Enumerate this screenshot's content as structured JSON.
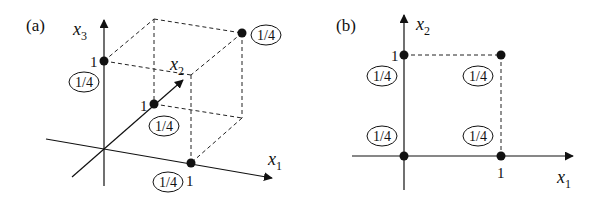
{
  "figure": {
    "panel_a": {
      "label": "(a)",
      "axes": {
        "x1": {
          "name": "x",
          "sub": "1",
          "tick": "1"
        },
        "x2": {
          "name": "x",
          "sub": "2",
          "tick": "1"
        },
        "x3": {
          "name": "x",
          "sub": "3",
          "tick": "1"
        }
      },
      "points": [
        {
          "coords": "(0,0,1)",
          "prob": "1/4"
        },
        {
          "coords": "(0,1,0)",
          "prob": "1/4"
        },
        {
          "coords": "(1,0,0)",
          "prob": "1/4"
        },
        {
          "coords": "(1,1,1)",
          "prob": "1/4"
        }
      ]
    },
    "panel_b": {
      "label": "(b)",
      "axes": {
        "x1": {
          "name": "x",
          "sub": "1",
          "tick": "1"
        },
        "x2": {
          "name": "x",
          "sub": "2",
          "tick": "1"
        }
      },
      "points": [
        {
          "coords": "(0,1)",
          "prob": "1/4"
        },
        {
          "coords": "(1,1)",
          "prob": "1/4"
        },
        {
          "coords": "(0,0)",
          "prob": "1/4"
        },
        {
          "coords": "(1,0)",
          "prob": "1/4"
        }
      ]
    }
  }
}
